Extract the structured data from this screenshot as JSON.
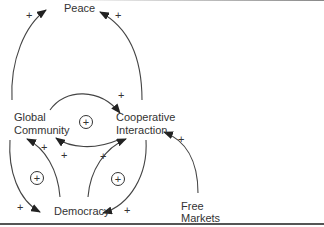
{
  "diagram": {
    "type": "causal-loop",
    "nodes": [
      {
        "id": "peace",
        "label": "Peace"
      },
      {
        "id": "global",
        "label_line1": "Global",
        "label_line2": "Community"
      },
      {
        "id": "coop",
        "label_line1": "Cooperative",
        "label_line2": "Interaction"
      },
      {
        "id": "democracy",
        "label": "Democracy"
      },
      {
        "id": "markets",
        "label_line1": "Free",
        "label_line2": "Markets"
      }
    ],
    "edges": [
      {
        "from": "Global Community",
        "to": "Peace",
        "polarity": "+"
      },
      {
        "from": "Cooperative Interaction",
        "to": "Peace",
        "polarity": "+"
      },
      {
        "from": "Global Community",
        "to": "Cooperative Interaction",
        "polarity": "+"
      },
      {
        "from": "Cooperative Interaction",
        "to": "Global Community",
        "polarity": "+"
      },
      {
        "from": "Democracy",
        "to": "Global Community",
        "polarity": "+"
      },
      {
        "from": "Global Community",
        "to": "Democracy",
        "polarity": "+"
      },
      {
        "from": "Democracy",
        "to": "Cooperative Interaction",
        "polarity": "+"
      },
      {
        "from": "Cooperative Interaction",
        "to": "Democracy",
        "polarity": "+"
      },
      {
        "from": "Free Markets",
        "to": "Cooperative Interaction",
        "polarity": "+"
      }
    ],
    "loops": [
      {
        "id": "top",
        "polarity": "+"
      },
      {
        "id": "left",
        "polarity": "+"
      },
      {
        "id": "right",
        "polarity": "+"
      }
    ],
    "signs": {
      "plus": "+"
    },
    "colors": {
      "line": "#333333",
      "text": "#333333"
    }
  }
}
